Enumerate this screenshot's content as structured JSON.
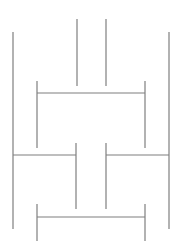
{
  "diagram": {
    "background": "#ffffff",
    "stroke": "#7f7f7f",
    "lines": [
      {
        "id": "left-outer-vertical",
        "x1": 13,
        "y1": 32,
        "x2": 13,
        "y2": 229
      },
      {
        "id": "right-outer-vertical",
        "x1": 169,
        "y1": 32,
        "x2": 169,
        "y2": 229
      },
      {
        "id": "center-left-top-vertical",
        "x1": 77,
        "y1": 19,
        "x2": 77,
        "y2": 86
      },
      {
        "id": "center-right-top-vertical",
        "x1": 106,
        "y1": 19,
        "x2": 106,
        "y2": 86
      },
      {
        "id": "upper-bracket-horizontal",
        "x1": 37,
        "y1": 93,
        "x2": 145,
        "y2": 93
      },
      {
        "id": "upper-bracket-left-vertical",
        "x1": 37,
        "y1": 81,
        "x2": 37,
        "y2": 148
      },
      {
        "id": "upper-bracket-right-vertical",
        "x1": 145,
        "y1": 81,
        "x2": 145,
        "y2": 148
      },
      {
        "id": "middle-left-horizontal",
        "x1": 13,
        "y1": 155,
        "x2": 76,
        "y2": 155
      },
      {
        "id": "middle-left-vertical",
        "x1": 76,
        "y1": 143,
        "x2": 76,
        "y2": 209
      },
      {
        "id": "middle-right-horizontal",
        "x1": 106,
        "y1": 155,
        "x2": 169,
        "y2": 155
      },
      {
        "id": "middle-right-vertical",
        "x1": 106,
        "y1": 143,
        "x2": 106,
        "y2": 209
      },
      {
        "id": "lower-bracket-horizontal",
        "x1": 37,
        "y1": 217,
        "x2": 145,
        "y2": 217
      },
      {
        "id": "lower-bracket-left-vertical",
        "x1": 37,
        "y1": 204,
        "x2": 37,
        "y2": 241
      },
      {
        "id": "lower-bracket-right-vertical",
        "x1": 145,
        "y1": 204,
        "x2": 145,
        "y2": 241
      }
    ]
  }
}
